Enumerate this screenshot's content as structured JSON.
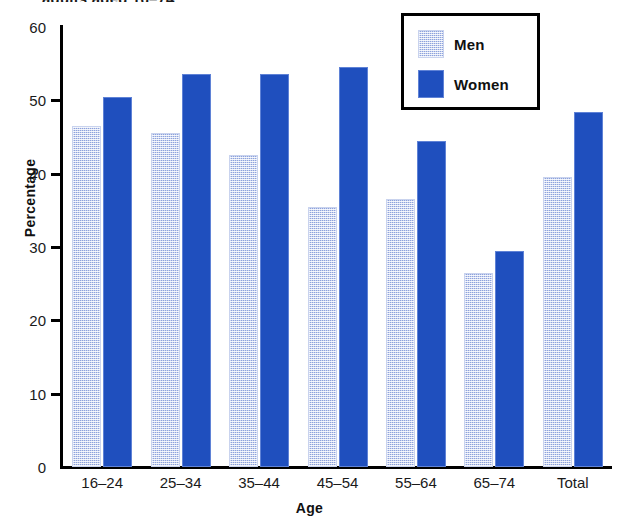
{
  "title": "adults aged 16–74",
  "legend": {
    "box_name": "legend-box",
    "items": [
      {
        "label": "Men",
        "color": "#8da2dc",
        "pattern": "stipple"
      },
      {
        "label": "Women",
        "color": "#1f4fbe",
        "pattern": "solid"
      }
    ]
  },
  "axes": {
    "ylabel": "Percentage",
    "xlabel": "Age",
    "yticks": [
      "60",
      "50",
      "40",
      "30",
      "20",
      "10",
      "0"
    ]
  },
  "chart_data": {
    "type": "bar",
    "title": "adults aged 16–74",
    "xlabel": "Age",
    "ylabel": "Percentage",
    "ylim": [
      0,
      60
    ],
    "ytick_step": 10,
    "grid": false,
    "legend_position": "top-right",
    "categories": [
      "16–24",
      "25–34",
      "35–44",
      "45–54",
      "55–64",
      "65–74",
      "Total"
    ],
    "series": [
      {
        "name": "Men",
        "color": "#8da2dc",
        "values": [
          46.5,
          45.5,
          42.6,
          35.5,
          36.6,
          26.5,
          39.5
        ]
      },
      {
        "name": "Women",
        "color": "#1f4fbe",
        "values": [
          50.5,
          53.6,
          53.6,
          54.6,
          44.4,
          29.5,
          48.4
        ]
      }
    ]
  }
}
